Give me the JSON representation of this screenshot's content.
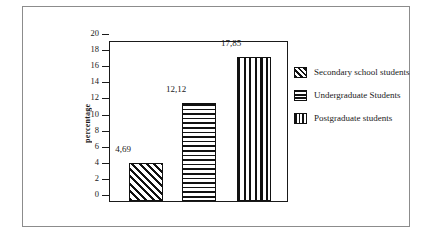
{
  "chart_data": {
    "type": "bar",
    "title": "",
    "subtitle": "",
    "xlabel": "",
    "ylabel": "percentage",
    "ylim": [
      0,
      20
    ],
    "y_ticks": [
      0,
      2,
      4,
      6,
      8,
      10,
      12,
      14,
      16,
      18,
      20
    ],
    "y_tick_labels": [
      "0",
      "2",
      "4",
      "6",
      "8",
      "10",
      "12",
      "14",
      "16",
      "18",
      "20"
    ],
    "grid": false,
    "decimal_separator": ",",
    "legend_position": "right",
    "categories": [
      "Secondary school students",
      "Undergraduate Students",
      "Postgraduate students"
    ],
    "values": [
      4.69,
      12.12,
      17.85
    ],
    "data_labels": [
      "4,69",
      "12,12",
      "17,85"
    ],
    "patterns": [
      "diagonal-hatch",
      "horizontal-lines",
      "vertical-lines"
    ],
    "colors": {
      "bar_line": "#111111",
      "bar_fill": "#ffffff",
      "axis": "#1a1a1a",
      "frame": "#8c8c8c",
      "background": "#ffffff"
    },
    "bars": [
      {
        "label": "Secondary school students",
        "value": 4.69,
        "data_label": "4,69",
        "pattern": "diagonal-hatch"
      },
      {
        "label": "Undergraduate Students",
        "value": 12.12,
        "data_label": "12,12",
        "pattern": "horizontal-lines"
      },
      {
        "label": "Postgraduate students",
        "value": 17.85,
        "data_label": "17,85",
        "pattern": "vertical-lines"
      }
    ],
    "legend": [
      {
        "label": "Secondary school students",
        "pattern": "diagonal-hatch"
      },
      {
        "label": "Undergraduate Students",
        "pattern": "horizontal-lines"
      },
      {
        "label": "Postgraduate students",
        "pattern": "vertical-lines"
      }
    ]
  }
}
